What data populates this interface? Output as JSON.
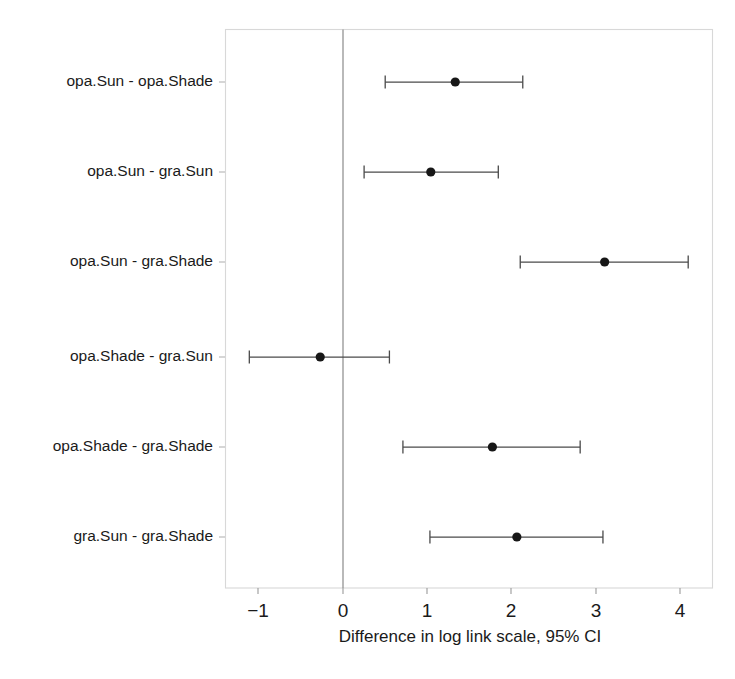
{
  "chart_data": {
    "type": "scatter",
    "subtype": "forest-plot",
    "title": "",
    "xlabel": "Difference in log link scale, 95% CI",
    "ylabel": "",
    "xlim": [
      -1.45,
      4.4
    ],
    "xticks": [
      -1,
      0,
      1,
      2,
      3,
      4
    ],
    "xtick_labels": [
      "−1",
      "0",
      "1",
      "2",
      "3",
      "4"
    ],
    "grid": false,
    "legend": null,
    "reference_line": 0,
    "categories": [
      "opa.Sun - opa.Shade",
      "opa.Sun - gra.Sun",
      "opa.Sun - gra.Shade",
      "opa.Shade - gra.Sun",
      "opa.Shade - gra.Shade",
      "gra.Sun - gra.Shade"
    ],
    "points": [
      {
        "label": "opa.Sun - opa.Shade",
        "estimate": 1.33,
        "ci_low": 0.5,
        "ci_high": 2.13
      },
      {
        "label": "opa.Sun - gra.Sun",
        "estimate": 1.04,
        "ci_low": 0.25,
        "ci_high": 1.84
      },
      {
        "label": "opa.Sun - gra.Shade",
        "estimate": 3.1,
        "ci_low": 2.1,
        "ci_high": 4.09
      },
      {
        "label": "opa.Shade - gra.Sun",
        "estimate": -0.27,
        "ci_low": -1.11,
        "ci_high": 0.55
      },
      {
        "label": "opa.Shade - gra.Shade",
        "estimate": 1.77,
        "ci_low": 0.71,
        "ci_high": 2.81
      },
      {
        "label": "gra.Sun - gra.Shade",
        "estimate": 2.06,
        "ci_low": 1.03,
        "ci_high": 3.08
      }
    ],
    "colors": {
      "point": "#171717",
      "ci": "#4a4a4a",
      "frame": "#d8d8d8",
      "zero_line": "#8a8a8a",
      "background": "#ffffff",
      "text": "#1a1a1a"
    }
  },
  "axis": {
    "x_title": "Difference in log link scale, 95% CI",
    "tick_labels": [
      "−1",
      "0",
      "1",
      "2",
      "3",
      "4"
    ]
  },
  "rows": {
    "r0": "opa.Sun - opa.Shade",
    "r1": "opa.Sun - gra.Sun",
    "r2": "opa.Sun - gra.Shade",
    "r3": "opa.Shade - gra.Sun",
    "r4": "opa.Shade - gra.Shade",
    "r5": "gra.Sun - gra.Shade"
  }
}
